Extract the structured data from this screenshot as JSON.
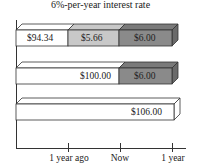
{
  "title": "6%-per-year interest rate",
  "colors": {
    "white": "#ffffff",
    "light": "#c8c8c8",
    "dark": "#8a8a8a",
    "line": "#333333"
  },
  "bars": [
    {
      "segments": [
        {
          "label": "$94.34",
          "shade": "white"
        },
        {
          "label": "$5.66",
          "shade": "light"
        },
        {
          "label": "$6.00",
          "shade": "dark"
        }
      ]
    },
    {
      "segments": [
        {
          "label": "$100.00",
          "shade": "white"
        },
        {
          "label": "$6.00",
          "shade": "dark"
        }
      ]
    },
    {
      "segments": [
        {
          "label": "$106.00",
          "shade": "white"
        }
      ]
    }
  ],
  "axis": {
    "ticks": [
      "1 year ago",
      "Now",
      "1 year"
    ]
  }
}
